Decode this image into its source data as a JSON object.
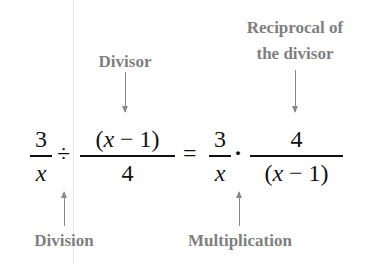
{
  "labels": {
    "divisor": "Divisor",
    "reciprocal_line1": "Reciprocal of",
    "reciprocal_line2": "the divisor",
    "division": "Division",
    "multiplication": "Multiplication"
  },
  "equation": {
    "lhs_frac1": {
      "numerator": "3",
      "denominator": "x"
    },
    "division_op": "÷",
    "lhs_frac2": {
      "numerator_open": "(",
      "numerator_var": "x",
      "numerator_rest": " − 1)",
      "denominator": "4"
    },
    "equals": "=",
    "rhs_frac1": {
      "numerator": "3",
      "denominator": "x"
    },
    "mult_op": "·",
    "rhs_frac2": {
      "numerator": "4",
      "denominator_open": "(",
      "denominator_var": "x",
      "denominator_rest": " − 1)"
    }
  },
  "colors": {
    "label": "#7f7f7f",
    "math": "#111111",
    "arrow": "#8a8a8a"
  }
}
